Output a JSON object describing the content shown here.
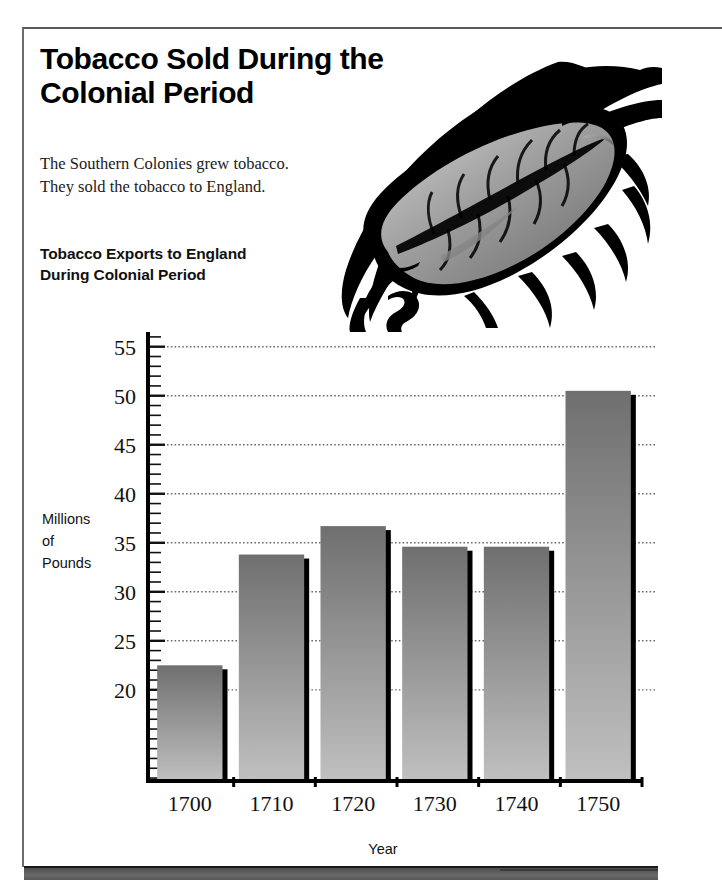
{
  "page": {
    "title": "Tobacco Sold During the Colonial Period",
    "intro_line1": "The Southern Colonies grew tobacco.",
    "intro_line2": "They sold the tobacco to England.",
    "chart_heading_line1": "Tobacco Exports to England",
    "chart_heading_line2": "During Colonial Period",
    "illustration_name": "tobacco-leaf-illustration"
  },
  "colors": {
    "ink": "#000000",
    "frame": "#6d6d6d",
    "bar_top": "#6f6f6f",
    "bar_bottom": "#b9b9b9",
    "bar_shadow": "#000000",
    "gridline": "#6b6b6b",
    "strip": "#585858"
  },
  "chart_data": {
    "type": "bar",
    "title": "Tobacco Exports to England During Colonial Period",
    "xlabel": "Year",
    "ylabel": "Millions of Pounds",
    "ylabel_lines": [
      "Millions",
      "of",
      "Pounds"
    ],
    "categories": [
      "1700",
      "1710",
      "1720",
      "1730",
      "1740",
      "1750"
    ],
    "values": [
      22.5,
      33.8,
      36.7,
      34.6,
      34.6,
      50.5
    ],
    "ylim": [
      10.7,
      56.5
    ],
    "ytick_labels": [
      "20",
      "25",
      "30",
      "35",
      "40",
      "45",
      "50",
      "55"
    ],
    "yticks": [
      20,
      25,
      30,
      35,
      40,
      45,
      50,
      55
    ],
    "minor_tick_step": 1,
    "grid": true,
    "grid_style": "dotted",
    "legend": null
  }
}
